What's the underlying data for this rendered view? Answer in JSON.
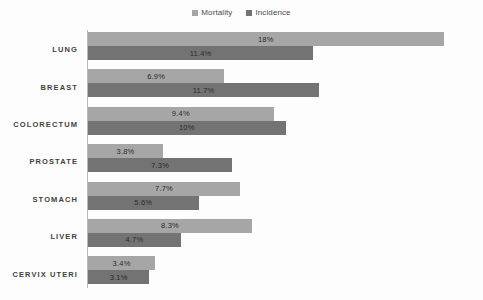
{
  "chart_data": {
    "type": "bar",
    "orientation": "horizontal",
    "title": "",
    "subtitle": "",
    "xlabel": "",
    "ylabel": "",
    "grid": false,
    "legend_position": "top-center",
    "axis_visible": "y-only",
    "xlim": [
      0,
      20
    ],
    "categories": [
      "LUNG",
      "BREAST",
      "COLORECTUM",
      "PROSTATE",
      "STOMACH",
      "LIVER",
      "CERVIX UTERI"
    ],
    "series": [
      {
        "name": "Mortality",
        "color": "#a6a6a6",
        "values": [
          18,
          6.9,
          9.4,
          3.8,
          7.7,
          8.3,
          3.4
        ],
        "labels": [
          "18%",
          "6.9%",
          "9.4%",
          "3.8%",
          "7.7%",
          "8.3%",
          "3.4%"
        ]
      },
      {
        "name": "Incidence",
        "color": "#737373",
        "values": [
          11.4,
          11.7,
          10,
          7.3,
          5.6,
          4.7,
          3.1
        ],
        "labels": [
          "11.4%",
          "11.7%",
          "10%",
          "7.3%",
          "5.6%",
          "4.7%",
          "3.1%"
        ]
      }
    ]
  },
  "legend": {
    "entries": [
      {
        "label": "Mortality",
        "color": "#a6a6a6"
      },
      {
        "label": "Incidence",
        "color": "#737373"
      }
    ]
  },
  "colors": {
    "mortality": "#a6a6a6",
    "incidence": "#737373",
    "axis": "#b9b9b9",
    "background": "#fdfdfd",
    "label_text": "#3f3f3f",
    "value_text": "#2b2b2b"
  }
}
